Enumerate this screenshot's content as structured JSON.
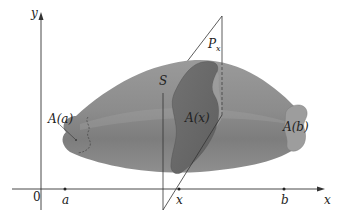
{
  "figure": {
    "labels": {
      "y_axis": "y",
      "x_axis": "x",
      "origin": "0",
      "a": "a",
      "b": "b",
      "x_point": "x",
      "solid": "S",
      "plane_main": "P",
      "plane_sub": "x",
      "area_a": "A(a)",
      "area_x": "A(x)",
      "area_b": "A(b)"
    },
    "colors": {
      "solid_body": "#8a8a8a",
      "solid_light": "#a8a8a8",
      "cross_section": "#6e6e6e",
      "end_face": "#9c9c9c",
      "lines": "#333333"
    }
  }
}
